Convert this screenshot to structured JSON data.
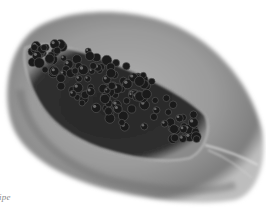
{
  "image": {
    "subject": "halved papaya with seeds",
    "style": "grayscale photograph",
    "colors": {
      "background": "#ffffff",
      "flesh_outer": "#8c8c8c",
      "flesh_inner": "#b4b4b4",
      "rim_highlight": "#d8d8d8",
      "seed_cavity": "#2a2a2a",
      "seed": "#1c1c1c",
      "seed_highlight": "#9a9a9a"
    }
  },
  "caption": {
    "text": "ipe"
  }
}
